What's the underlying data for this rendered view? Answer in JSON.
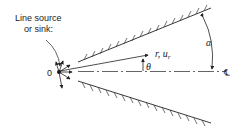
{
  "diagram": {
    "source_label_line1": "Line source",
    "source_label_line2": "or sink:",
    "origin_label": "0",
    "ray_label": "r, u",
    "ray_label_sub": "r",
    "theta_label": "θ",
    "alpha_label": "α",
    "centerline_label": "℄",
    "colors": {
      "ink": "#222222",
      "background": "#ffffff"
    }
  }
}
